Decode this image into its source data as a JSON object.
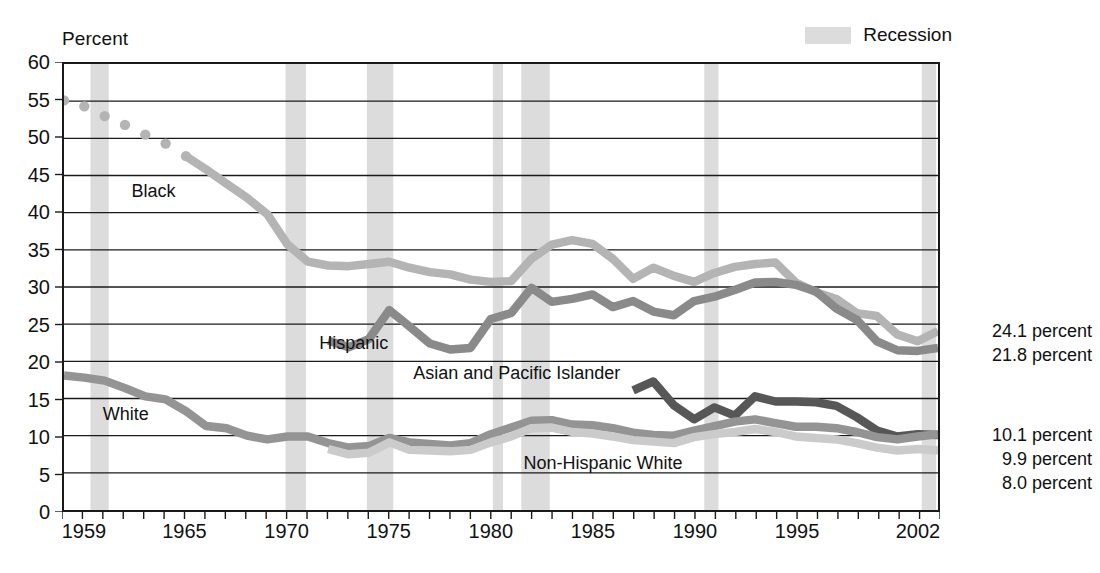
{
  "title": "",
  "axis_title": "Percent",
  "legend": {
    "recession_label": "Recession",
    "recession_color": "#dcdcdc"
  },
  "series_labels": {
    "black": "Black",
    "hispanic": "Hispanic",
    "asian": "Asian and Pacific Islander",
    "white": "White",
    "non_hispanic_white": "Non-Hispanic White"
  },
  "end_labels": {
    "upper": [
      "24.1 percent",
      "21.8 percent"
    ],
    "lower": [
      "10.1 percent",
      "9.9 percent",
      "8.0 percent"
    ]
  },
  "chart_data": {
    "type": "line",
    "xlabel": "",
    "ylabel": "Percent",
    "xlim": [
      1959,
      2002
    ],
    "ylim": [
      0,
      60
    ],
    "ytick_step": 5,
    "yticks": [
      0,
      5,
      10,
      15,
      20,
      25,
      30,
      35,
      40,
      45,
      50,
      55,
      60
    ],
    "xticks_labeled": [
      1959,
      1965,
      1970,
      1975,
      1980,
      1985,
      1990,
      1995,
      2002
    ],
    "xtick_minor_step": 1,
    "grid": "horizontal",
    "legend_position": "top-right",
    "colors": {
      "black": "#b4b4b4",
      "hispanic": "#8a8a8a",
      "asian": "#575757",
      "white": "#949494",
      "non_hispanic_white": "#cbcbcb"
    },
    "series": [
      {
        "name": "Black",
        "color": "#b4b4b4",
        "style_note": "dotted 1959-1965, solid from 1966",
        "dotted_until": 1966,
        "x": [
          1959,
          1960,
          1961,
          1962,
          1963,
          1964,
          1965,
          1966,
          1967,
          1968,
          1969,
          1970,
          1971,
          1972,
          1973,
          1974,
          1975,
          1976,
          1977,
          1978,
          1979,
          1980,
          1981,
          1982,
          1983,
          1984,
          1985,
          1986,
          1987,
          1988,
          1989,
          1990,
          1991,
          1992,
          1993,
          1994,
          1995,
          1996,
          1997,
          1998,
          1999,
          2000,
          2001,
          2002
        ],
        "values": [
          55.1,
          54.3,
          53.0,
          51.8,
          50.5,
          49.3,
          47.6,
          45.8,
          43.9,
          42.0,
          39.8,
          35.7,
          33.4,
          32.9,
          32.8,
          33.1,
          33.4,
          32.6,
          32.0,
          31.7,
          31.0,
          30.7,
          30.8,
          33.8,
          35.7,
          36.3,
          35.8,
          33.8,
          31.1,
          32.6,
          31.5,
          30.7,
          31.9,
          32.7,
          33.1,
          33.3,
          30.6,
          29.3,
          28.4,
          26.5,
          26.1,
          23.6,
          22.7,
          24.1
        ]
      },
      {
        "name": "Hispanic",
        "color": "#8a8a8a",
        "style_note": "solid from 1972",
        "x": [
          1972,
          1973,
          1974,
          1975,
          1976,
          1977,
          1978,
          1979,
          1980,
          1981,
          1982,
          1983,
          1984,
          1985,
          1986,
          1987,
          1988,
          1989,
          1990,
          1991,
          1992,
          1993,
          1994,
          1995,
          1996,
          1997,
          1998,
          1999,
          2000,
          2001,
          2002
        ],
        "values": [
          22.8,
          21.9,
          23.0,
          26.9,
          24.7,
          22.4,
          21.6,
          21.8,
          25.7,
          26.5,
          29.9,
          28.0,
          28.4,
          29.0,
          27.3,
          28.1,
          26.7,
          26.2,
          28.1,
          28.7,
          29.6,
          30.6,
          30.7,
          30.3,
          29.4,
          27.1,
          25.6,
          22.7,
          21.5,
          21.4,
          21.8
        ]
      },
      {
        "name": "Asian and Pacific Islander",
        "color": "#575757",
        "style_note": "solid from 1987",
        "x": [
          1987,
          1988,
          1989,
          1990,
          1991,
          1992,
          1993,
          1994,
          1995,
          1996,
          1997,
          1998,
          1999,
          2000,
          2001,
          2002
        ],
        "values": [
          16.1,
          17.3,
          14.1,
          12.2,
          13.8,
          12.7,
          15.3,
          14.6,
          14.6,
          14.5,
          14.0,
          12.5,
          10.7,
          9.9,
          10.2,
          10.1
        ]
      },
      {
        "name": "White",
        "color": "#949494",
        "x": [
          1959,
          1960,
          1961,
          1962,
          1963,
          1964,
          1965,
          1966,
          1967,
          1968,
          1969,
          1970,
          1971,
          1972,
          1973,
          1974,
          1975,
          1976,
          1977,
          1978,
          1979,
          1980,
          1981,
          1982,
          1983,
          1984,
          1985,
          1986,
          1987,
          1988,
          1989,
          1990,
          1991,
          1992,
          1993,
          1994,
          1995,
          1996,
          1997,
          1998,
          1999,
          2000,
          2001,
          2002
        ],
        "values": [
          18.1,
          17.8,
          17.4,
          16.4,
          15.3,
          14.9,
          13.3,
          11.3,
          11.0,
          10.0,
          9.5,
          9.9,
          9.9,
          9.0,
          8.4,
          8.6,
          9.7,
          9.1,
          8.9,
          8.7,
          9.0,
          10.2,
          11.1,
          12.0,
          12.1,
          11.5,
          11.4,
          11.0,
          10.4,
          10.1,
          10.0,
          10.7,
          11.3,
          11.9,
          12.2,
          11.7,
          11.2,
          11.2,
          11.0,
          10.5,
          9.8,
          9.5,
          9.9,
          10.2
        ]
      },
      {
        "name": "Non-Hispanic White",
        "color": "#cbcbcb",
        "style_note": "solid from 1972",
        "x": [
          1972,
          1973,
          1974,
          1975,
          1976,
          1977,
          1978,
          1979,
          1980,
          1981,
          1982,
          1983,
          1984,
          1985,
          1986,
          1987,
          1988,
          1989,
          1990,
          1991,
          1992,
          1993,
          1994,
          1995,
          1996,
          1997,
          1998,
          1999,
          2000,
          2001,
          2002
        ],
        "values": [
          8.2,
          7.5,
          7.7,
          9.1,
          8.1,
          8.0,
          7.9,
          8.1,
          9.1,
          9.9,
          11.0,
          11.1,
          10.5,
          10.3,
          9.9,
          9.4,
          9.2,
          9.0,
          9.8,
          10.2,
          10.5,
          10.9,
          10.5,
          9.9,
          9.7,
          9.5,
          9.0,
          8.4,
          8.0,
          8.2,
          8.0
        ]
      }
    ],
    "recessions": [
      {
        "start": 1960.3,
        "end": 1961.2
      },
      {
        "start": 1969.9,
        "end": 1970.9
      },
      {
        "start": 1973.9,
        "end": 1975.2
      },
      {
        "start": 1980.1,
        "end": 1980.6
      },
      {
        "start": 1981.5,
        "end": 1982.9
      },
      {
        "start": 1990.5,
        "end": 1991.2
      },
      {
        "start": 2001.2,
        "end": 2001.9
      }
    ]
  }
}
